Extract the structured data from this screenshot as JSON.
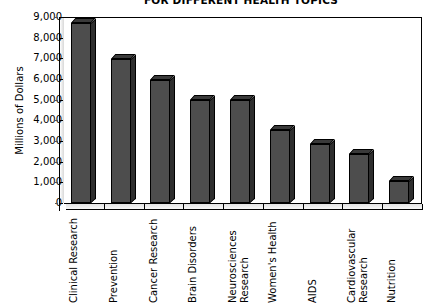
{
  "chart_data": {
    "type": "bar",
    "title": "FOR DIFFERENT HEALTH TOPICS",
    "xlabel": "",
    "ylabel": "Millions of Dollars",
    "ylim": [
      0,
      9000
    ],
    "ytick_step": 1000,
    "grid": false,
    "legend": null,
    "categories": [
      "Clinical Research",
      "Prevention",
      "Cancer Research",
      "Brain Disorders",
      "Neurosciences\nResearch",
      "Women's Health",
      "AIDS",
      "Cardiovascular\nResearch",
      "Nutrition"
    ],
    "values": [
      8700,
      6950,
      5950,
      5000,
      5000,
      3550,
      2850,
      2350,
      1050
    ],
    "ytick_labels": [
      "9,000",
      "8,000",
      "7,000",
      "6,000",
      "5,000",
      "4,000",
      "3,000",
      "2,000",
      "1,000",
      "0"
    ],
    "ytick_values": [
      9000,
      8000,
      7000,
      6000,
      5000,
      4000,
      3000,
      2000,
      1000,
      0
    ],
    "bar_color": "#4d4d4d",
    "bar_top_color": "#3a3a3a",
    "bar_side_color": "#2e2e2e",
    "outline_color": "#000000",
    "background_color": "#ffffff",
    "style": "3d-column"
  }
}
